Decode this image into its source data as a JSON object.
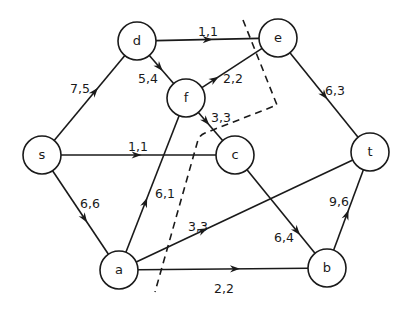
{
  "diagram": {
    "type": "flow-network",
    "nodes": [
      {
        "id": "d",
        "label": "d"
      },
      {
        "id": "e",
        "label": "e"
      },
      {
        "id": "f",
        "label": "f"
      },
      {
        "id": "s",
        "label": "s"
      },
      {
        "id": "c",
        "label": "c"
      },
      {
        "id": "t",
        "label": "t"
      },
      {
        "id": "a",
        "label": "a"
      },
      {
        "id": "b",
        "label": "b"
      }
    ],
    "edges": [
      {
        "from": "s",
        "to": "d",
        "label": "7,5",
        "capacity": 7,
        "flow": 5
      },
      {
        "from": "d",
        "to": "e",
        "label": "1,1",
        "capacity": 1,
        "flow": 1
      },
      {
        "from": "d",
        "to": "f",
        "label": "5,4",
        "capacity": 5,
        "flow": 4
      },
      {
        "from": "f",
        "to": "e",
        "label": "2,2",
        "capacity": 2,
        "flow": 2
      },
      {
        "from": "f",
        "to": "c",
        "label": "3,3",
        "capacity": 3,
        "flow": 3
      },
      {
        "from": "e",
        "to": "t",
        "label": "6,3",
        "capacity": 6,
        "flow": 3
      },
      {
        "from": "s",
        "to": "c",
        "label": "1,1",
        "capacity": 1,
        "flow": 1
      },
      {
        "from": "s",
        "to": "a",
        "label": "6,6",
        "capacity": 6,
        "flow": 6
      },
      {
        "from": "a",
        "to": "f",
        "label": "6,1",
        "capacity": 6,
        "flow": 1
      },
      {
        "from": "a",
        "to": "t",
        "label": "3,3",
        "capacity": 3,
        "flow": 3
      },
      {
        "from": "c",
        "to": "b",
        "label": "6,4",
        "capacity": 6,
        "flow": 4
      },
      {
        "from": "a",
        "to": "b",
        "label": "2,2",
        "capacity": 2,
        "flow": 2
      },
      {
        "from": "b",
        "to": "t",
        "label": "9,6",
        "capacity": 9,
        "flow": 6
      }
    ],
    "cut": {
      "style": "dashed",
      "separates": [
        "s",
        "a",
        "d",
        "f"
      ]
    }
  }
}
